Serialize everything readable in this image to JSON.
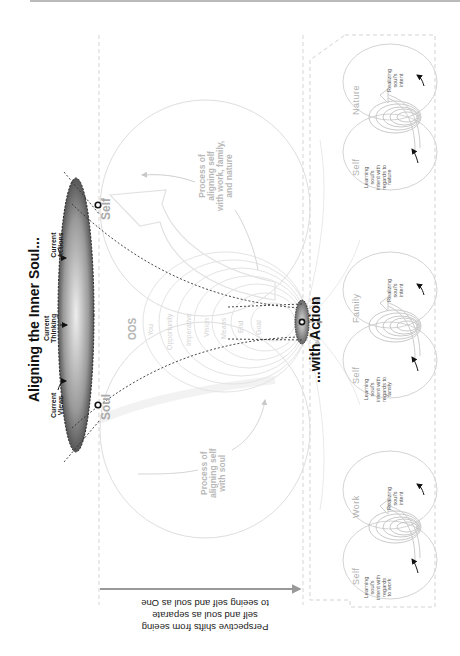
{
  "title": "Aligning the Inner Soul...",
  "action_title": "...with Action",
  "lens_labels": {
    "views": "Current\nViews",
    "thinking": "Current\nThinking",
    "actions": "Current\nActions"
  },
  "endpoints": {
    "soul": "Soul",
    "self": "Self"
  },
  "oos": {
    "label": "OOS",
    "rings": [
      "You",
      "Opportunity",
      "Imperative",
      "Vision",
      "Means",
      "End",
      "Goal"
    ]
  },
  "process_labels": {
    "soul": "Process of\naligning self\nwith soul",
    "work_family_nature": "Process of\naligning self\nwith work, family,\nand nature"
  },
  "perspective": {
    "line1": "Perspective shifts from seeing",
    "line2": "self and soul as separate",
    "line3": "to seeing self and soul as One"
  },
  "venns": [
    {
      "self_label": "Self",
      "other_label": "Work",
      "learning": "Learning\nsoul's\nintent with\nregards\nto work",
      "realizing": "Realizing\nsoul's\nintent"
    },
    {
      "self_label": "Self",
      "other_label": "Family",
      "learning": "Learning\nsoul's\nintent with\nregards to\nfamily",
      "realizing": "Realizing\nsoul's\nintent"
    },
    {
      "self_label": "Self",
      "other_label": "Nature",
      "learning": "Learning\nsoul's\nintent with\nregards to\nnature",
      "realizing": "Realizing\nsoul's\nintent"
    }
  ],
  "colors": {
    "lens_dark": "#555555",
    "lens_light": "#e6e6e6",
    "faint_line": "#d8d8d8",
    "dashed_box": "#d0d0d0",
    "text_dark": "#111111"
  }
}
